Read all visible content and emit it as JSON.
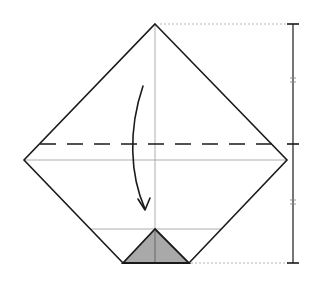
{
  "diagram": {
    "type": "origami-fold-diagram",
    "colors": {
      "outline": "#1a1a1a",
      "crease": "#9a9a9a",
      "dotted_reference": "#b5b5b5",
      "shaded_flap": "#a9a9a9",
      "background": "#ffffff"
    },
    "paper_outline": {
      "points": [
        [
          155,
          24
        ],
        [
          287,
          160
        ],
        [
          189,
          263
        ],
        [
          123,
          263
        ],
        [
          24,
          160
        ]
      ]
    },
    "creases": [
      {
        "name": "vertical-center-crease",
        "x1": 155,
        "y1": 24,
        "x2": 155,
        "y2": 263
      },
      {
        "name": "horizontal-center-crease",
        "x1": 24,
        "y1": 160,
        "x2": 287,
        "y2": 160
      },
      {
        "name": "lower-horizontal-crease",
        "x1": 91,
        "y1": 229,
        "x2": 221,
        "y2": 229
      }
    ],
    "valley_fold_line": {
      "x1": 40,
      "y1": 144,
      "x2": 272,
      "y2": 144,
      "dash": "16 11"
    },
    "shaded_flap": {
      "points": [
        [
          155,
          229
        ],
        [
          189,
          263
        ],
        [
          123,
          263
        ]
      ]
    },
    "fold_arrow": {
      "direction": "down",
      "path": "M 143 86 C 128 130, 130 175, 145 209",
      "arrowhead": [
        [
          138,
          199
        ],
        [
          145,
          210
        ],
        [
          150,
          198
        ]
      ]
    },
    "measurement_bar": {
      "x": 293,
      "top_y": 24,
      "middle_y": 144,
      "bottom_y": 263,
      "equal_marks_y": [
        80,
        202
      ],
      "segments": [
        "top-to-fold",
        "fold-to-bottom"
      ],
      "note": "two equal segments marked with double ticks"
    },
    "reference_lines": [
      {
        "name": "top-reference",
        "x1": 160,
        "y1": 24,
        "x2": 288,
        "y2": 24
      },
      {
        "name": "bottom-reference",
        "x1": 191,
        "y1": 263,
        "x2": 288,
        "y2": 263
      }
    ]
  }
}
